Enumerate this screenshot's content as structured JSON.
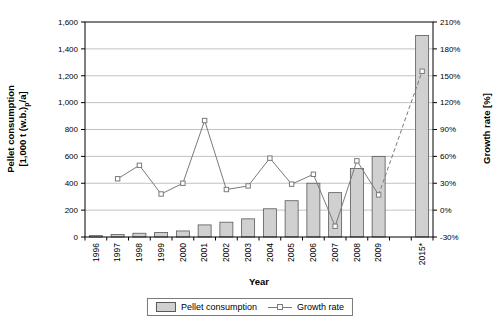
{
  "labels": {
    "y_left_line1": "Pellet consumption",
    "y_left_line2_pre": "[1,000 t (w.b.)",
    "y_left_line2_sub": "p",
    "y_left_line2_post": "/a]",
    "y_right": "Growth rate [%]",
    "x_axis": "Year"
  },
  "legend": {
    "pellet_label": "Pellet consumption",
    "growth_label": "Growth rate"
  },
  "colors": {
    "bar_fill": "#d0d0d0",
    "bar_border": "#595959",
    "line": "#7a7a7a",
    "gridline": "#b3b3b3",
    "axis": "#000000",
    "background": "#ffffff"
  },
  "chart_data": {
    "type": "bar",
    "subtype": "combo-bar-line-dual-axis",
    "categories": [
      "1996",
      "1997",
      "1998",
      "1999",
      "2000",
      "2001",
      "2002",
      "2003",
      "2004",
      "2005",
      "2006",
      "2007",
      "2008",
      "2009",
      "",
      "2015*"
    ],
    "series": [
      {
        "name": "Pellet consumption",
        "type": "bar",
        "axis": "left",
        "values": [
          10,
          18,
          28,
          33,
          45,
          90,
          110,
          135,
          210,
          270,
          400,
          330,
          510,
          600,
          null,
          1500
        ]
      },
      {
        "name": "Growth rate",
        "type": "line",
        "axis": "right",
        "marker": "open-square",
        "values": [
          null,
          35,
          50,
          18,
          30,
          100,
          23,
          27,
          58,
          29,
          40,
          -18,
          55,
          17,
          null,
          155
        ],
        "dashed_from_category": "2009",
        "note": "segment from 2009 to 2015* drawn dashed (forecast)"
      }
    ],
    "left_axis": {
      "title": "Pellet consumption [1,000 t (w.b.)p/a]",
      "min": 0,
      "max": 1600,
      "step": 200,
      "tick_labels": [
        "1,600",
        "1,400",
        "1,200",
        "1,000",
        "800",
        "600",
        "400",
        "200",
        "0"
      ]
    },
    "right_axis": {
      "title": "Growth rate [%]",
      "min": -30,
      "max": 210,
      "step": 30,
      "tick_labels": [
        "210%",
        "180%",
        "150%",
        "120%",
        "90%",
        "60%",
        "30%",
        "0%",
        "-30%"
      ]
    },
    "x_axis": {
      "title": "Year"
    },
    "grid": "horizontal",
    "legend_position": "bottom"
  }
}
